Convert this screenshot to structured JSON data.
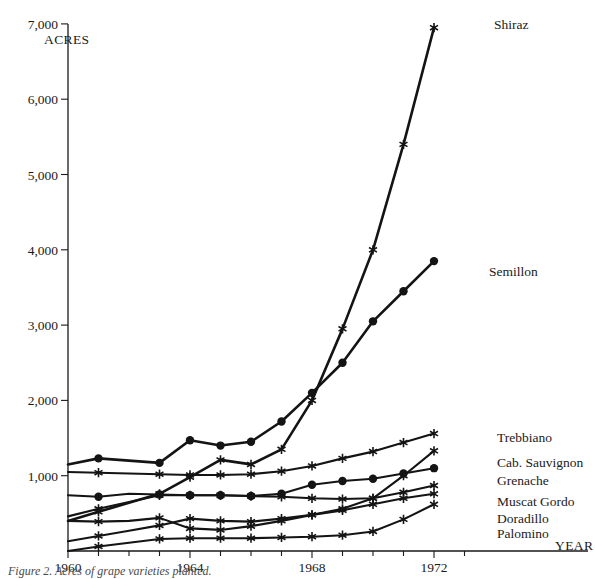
{
  "figure": {
    "caption": "Figure 2. Acres of grape varieties planted.",
    "y_axis_title": "ACRES",
    "x_axis_title": "YEAR"
  },
  "chart_data": {
    "type": "line",
    "title": "",
    "subtitle": "",
    "xlabel": "YEAR",
    "ylabel": "ACRES",
    "xlim": [
      1960,
      1973
    ],
    "ylim": [
      0,
      7000
    ],
    "grid": false,
    "legend_position": "right-end-of-line",
    "x_ticks_major": [
      1960,
      1964,
      1968,
      1972
    ],
    "x_ticks_minor": [
      1961,
      1962,
      1963,
      1965,
      1966,
      1967,
      1969,
      1970,
      1971,
      1973
    ],
    "x_tick_labels": [
      "1960",
      "1964",
      "1968",
      "1972"
    ],
    "y_ticks": [
      1000,
      2000,
      3000,
      4000,
      5000,
      6000,
      7000
    ],
    "y_tick_labels": [
      "1,000",
      "2,000",
      "3,000",
      "4,000",
      "5,000",
      "6,000",
      "7,000"
    ],
    "series": [
      {
        "name": "Shiraz",
        "marker": "star",
        "label": "Shiraz",
        "x": [
          1960,
          1961,
          1962,
          1963,
          1964,
          1965,
          1966,
          1967,
          1968,
          1969,
          1970,
          1971,
          1972
        ],
        "values": [
          400,
          520,
          640,
          760,
          980,
          1210,
          1150,
          1350,
          2000,
          2950,
          4000,
          5400,
          6950
        ]
      },
      {
        "name": "Semillon",
        "marker": "dot",
        "label": "Semillon",
        "x": [
          1960,
          1961,
          1962,
          1963,
          1964,
          1965,
          1966,
          1967,
          1968,
          1969,
          1970,
          1971,
          1972
        ],
        "values": [
          1150,
          1230,
          1200,
          1170,
          1470,
          1400,
          1450,
          1720,
          2100,
          2500,
          3050,
          3450,
          3850
        ]
      },
      {
        "name": "Trebbiano",
        "marker": "star",
        "label": "Trebbiano",
        "x": [
          1960,
          1961,
          1962,
          1963,
          1964,
          1965,
          1966,
          1967,
          1968,
          1969,
          1970,
          1971,
          1972
        ],
        "values": [
          1050,
          1040,
          1030,
          1020,
          1010,
          1010,
          1020,
          1060,
          1130,
          1230,
          1320,
          1440,
          1560
        ]
      },
      {
        "name": "Cab. Sauvignon",
        "marker": "star",
        "label": "Cab. Sauvignon",
        "x": [
          1960,
          1961,
          1962,
          1963,
          1964,
          1965,
          1966,
          1967,
          1968,
          1969,
          1970,
          1971,
          1972
        ],
        "values": [
          130,
          200,
          270,
          340,
          430,
          400,
          390,
          430,
          480,
          560,
          700,
          1000,
          1330
        ]
      },
      {
        "name": "Grenache",
        "marker": "dot",
        "label": "Grenache",
        "x": [
          1960,
          1961,
          1962,
          1963,
          1964,
          1965,
          1966,
          1967,
          1968,
          1969,
          1970,
          1971,
          1972
        ],
        "values": [
          740,
          720,
          760,
          750,
          740,
          740,
          730,
          760,
          880,
          930,
          960,
          1030,
          1100
        ]
      },
      {
        "name": "Muscat Gordo",
        "marker": "star",
        "label": "Muscat Gordo",
        "x": [
          1960,
          1961,
          1962,
          1963,
          1964,
          1965,
          1966,
          1967,
          1968,
          1969,
          1970,
          1971,
          1972
        ],
        "values": [
          460,
          560,
          650,
          740,
          740,
          740,
          730,
          720,
          700,
          690,
          700,
          780,
          870
        ]
      },
      {
        "name": "Doradillo",
        "marker": "star",
        "label": "Doradillo",
        "x": [
          1960,
          1961,
          1962,
          1963,
          1964,
          1965,
          1966,
          1967,
          1968,
          1969,
          1970,
          1971,
          1972
        ],
        "values": [
          400,
          390,
          400,
          440,
          300,
          280,
          330,
          400,
          480,
          540,
          620,
          700,
          760
        ]
      },
      {
        "name": "Palomino",
        "marker": "star",
        "label": "Palomino",
        "x": [
          1960,
          1961,
          1962,
          1963,
          1964,
          1965,
          1966,
          1967,
          1968,
          1969,
          1970,
          1971,
          1972
        ],
        "values": [
          0,
          60,
          110,
          160,
          170,
          170,
          170,
          180,
          190,
          210,
          260,
          420,
          620
        ]
      }
    ]
  },
  "series_labels": [
    {
      "name": "Shiraz",
      "text": "Shiraz",
      "left": 494,
      "top": 18
    },
    {
      "name": "Semillon",
      "text": "Semillon",
      "left": 489,
      "top": 265
    },
    {
      "name": "Trebbiano",
      "text": "Trebbiano",
      "left": 497,
      "top": 431
    },
    {
      "name": "Cab. Sauvignon",
      "text": "Cab. Sauvignon",
      "left": 497,
      "top": 456
    },
    {
      "name": "Grenache",
      "text": "Grenache",
      "left": 497,
      "top": 474
    },
    {
      "name": "Muscat Gordo",
      "text": "Muscat Gordo",
      "left": 497,
      "top": 495
    },
    {
      "name": "Doradillo",
      "text": "Doradillo",
      "left": 497,
      "top": 512
    },
    {
      "name": "Palomino",
      "text": "Palomino",
      "left": 497,
      "top": 527
    }
  ]
}
